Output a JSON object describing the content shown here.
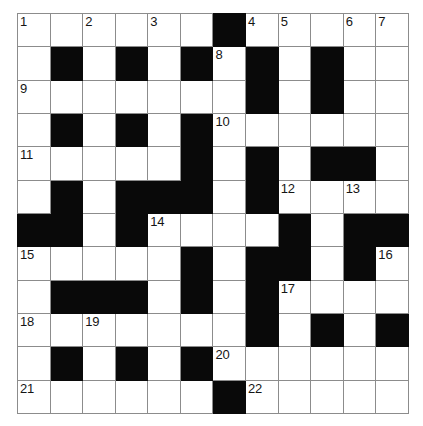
{
  "puzzle": {
    "type": "crossword-grid",
    "title": "Crossword Puzzle Grid",
    "rows": 12,
    "columns": 12,
    "colors": {
      "block": "#090909",
      "cell": "#ffffff",
      "gridline": "#8c8c8c",
      "number": "#151515"
    },
    "legend": {
      "0": "white-cell",
      "1": "black-block"
    },
    "grid": [
      [
        0,
        0,
        0,
        0,
        0,
        0,
        1,
        0,
        0,
        0,
        0,
        0
      ],
      [
        0,
        1,
        0,
        1,
        0,
        1,
        0,
        1,
        0,
        1,
        0,
        0
      ],
      [
        0,
        0,
        0,
        0,
        0,
        0,
        0,
        1,
        0,
        1,
        0,
        0
      ],
      [
        0,
        1,
        0,
        1,
        0,
        1,
        0,
        0,
        0,
        0,
        0,
        0
      ],
      [
        0,
        0,
        0,
        0,
        0,
        1,
        0,
        1,
        0,
        1,
        1,
        0
      ],
      [
        0,
        1,
        0,
        1,
        1,
        1,
        0,
        1,
        0,
        0,
        0,
        0
      ],
      [
        1,
        1,
        0,
        1,
        0,
        0,
        0,
        0,
        1,
        0,
        1,
        1
      ],
      [
        0,
        0,
        0,
        0,
        0,
        1,
        0,
        1,
        1,
        0,
        1,
        0
      ],
      [
        0,
        1,
        1,
        1,
        0,
        1,
        0,
        1,
        0,
        0,
        0,
        0
      ],
      [
        0,
        0,
        0,
        0,
        0,
        0,
        0,
        1,
        0,
        1,
        0,
        1
      ],
      [
        0,
        1,
        0,
        1,
        0,
        1,
        0,
        0,
        0,
        0,
        0,
        0
      ],
      [
        0,
        0,
        0,
        0,
        0,
        0,
        1,
        0,
        0,
        0,
        0,
        0
      ]
    ],
    "numbers": [
      {
        "row": 0,
        "col": 0,
        "label": "1"
      },
      {
        "row": 0,
        "col": 2,
        "label": "2"
      },
      {
        "row": 0,
        "col": 4,
        "label": "3"
      },
      {
        "row": 0,
        "col": 7,
        "label": "4"
      },
      {
        "row": 0,
        "col": 8,
        "label": "5"
      },
      {
        "row": 0,
        "col": 10,
        "label": "6"
      },
      {
        "row": 0,
        "col": 11,
        "label": "7"
      },
      {
        "row": 1,
        "col": 6,
        "label": "8"
      },
      {
        "row": 2,
        "col": 0,
        "label": "9"
      },
      {
        "row": 3,
        "col": 6,
        "label": "10"
      },
      {
        "row": 4,
        "col": 0,
        "label": "11"
      },
      {
        "row": 5,
        "col": 8,
        "label": "12"
      },
      {
        "row": 5,
        "col": 10,
        "label": "13"
      },
      {
        "row": 6,
        "col": 4,
        "label": "14"
      },
      {
        "row": 7,
        "col": 0,
        "label": "15"
      },
      {
        "row": 7,
        "col": 11,
        "label": "16"
      },
      {
        "row": 8,
        "col": 8,
        "label": "17"
      },
      {
        "row": 9,
        "col": 0,
        "label": "18"
      },
      {
        "row": 9,
        "col": 2,
        "label": "19"
      },
      {
        "row": 10,
        "col": 6,
        "label": "20"
      },
      {
        "row": 11,
        "col": 0,
        "label": "21"
      },
      {
        "row": 11,
        "col": 7,
        "label": "22"
      }
    ],
    "entries": []
  }
}
